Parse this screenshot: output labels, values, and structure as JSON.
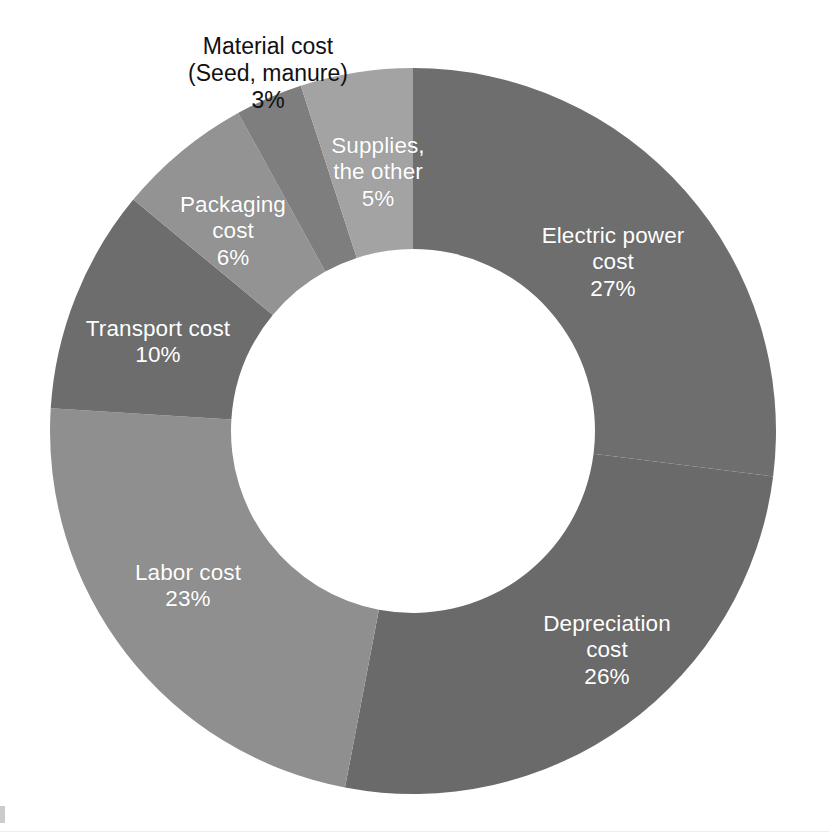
{
  "chart_data": {
    "type": "pie",
    "variant": "donut",
    "title": "",
    "subtitle": "",
    "xlabel": "",
    "ylabel": "",
    "legend_position": "none",
    "grid": false,
    "units": "%",
    "total": 100,
    "start_angle_deg": 0,
    "direction": "clockwise",
    "categories": [
      "Electric power cost",
      "Depreciation cost",
      "Labor cost",
      "Transport cost",
      "Packaging cost",
      "Material cost (Seed, manure)",
      "Supplies, the other"
    ],
    "values": [
      27,
      26,
      23,
      10,
      6,
      3,
      5
    ],
    "slices": [
      {
        "name": "Electric power cost",
        "label": "Electric power\ncost",
        "value": 27,
        "value_label": "27%",
        "color": "#6e6e6e",
        "label_color": "#ffffff",
        "label_placement": "inside",
        "label_x": 613,
        "label_y": 262
      },
      {
        "name": "Depreciation cost",
        "label": "Depreciation\ncost",
        "value": 26,
        "value_label": "26%",
        "color": "#6a6a6a",
        "label_color": "#ffffff",
        "label_placement": "inside",
        "label_x": 607,
        "label_y": 650
      },
      {
        "name": "Labor cost",
        "label": "Labor cost",
        "value": 23,
        "value_label": "23%",
        "color": "#8f8f8f",
        "label_color": "#ffffff",
        "label_placement": "inside",
        "label_x": 188,
        "label_y": 586
      },
      {
        "name": "Transport cost",
        "label": "Transport cost",
        "value": 10,
        "value_label": "10%",
        "color": "#6d6d6d",
        "label_color": "#ffffff",
        "label_placement": "inside",
        "label_x": 158,
        "label_y": 342
      },
      {
        "name": "Packaging cost",
        "label": "Packaging\ncost",
        "value": 6,
        "value_label": "6%",
        "color": "#939393",
        "label_color": "#ffffff",
        "label_placement": "inside",
        "label_x": 233,
        "label_y": 231
      },
      {
        "name": "Material cost (Seed, manure)",
        "label": "Material cost\n(Seed, manure)",
        "value": 3,
        "value_label": "3%",
        "color": "#7e7e7e",
        "label_color": "#111111",
        "label_placement": "outside",
        "label_x": 268,
        "label_y": 73
      },
      {
        "name": "Supplies, the other",
        "label": "Supplies,\nthe other",
        "value": 5,
        "value_label": "5%",
        "color": "#a3a3a3",
        "label_color": "#ffffff",
        "label_placement": "inside",
        "label_x": 378,
        "label_y": 172
      }
    ],
    "geometry": {
      "center_x": 413,
      "center_y": 431,
      "outer_radius": 363,
      "inner_radius": 182
    },
    "colors": {
      "background": "#ffffff",
      "hole": "#ffffff",
      "inside_label_text": "#ffffff",
      "outside_label_text": "#111111"
    }
  }
}
